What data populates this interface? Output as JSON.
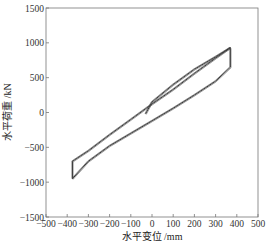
{
  "chart_data": {
    "type": "line",
    "title": "",
    "xlabel": "水平变位 /mm",
    "ylabel": "水平荷重 /kN",
    "xlim": [
      -500,
      500
    ],
    "ylim": [
      -1500,
      1500
    ],
    "x_ticks": [
      "-500",
      "-400",
      "-300",
      "-200",
      "-100",
      "0",
      "100",
      "200",
      "300",
      "400",
      "500"
    ],
    "y_ticks": [
      "1500",
      "1000",
      "500",
      "0",
      "-500",
      "-1000",
      "-1500"
    ],
    "grid": false,
    "legend": null,
    "series": [
      {
        "name": "hysteresis loop",
        "x": [
          -30,
          0,
          100,
          200,
          300,
          370,
          370,
          300,
          200,
          100,
          0,
          -100,
          -200,
          -300,
          -375,
          -375,
          -300,
          -200,
          -100,
          0,
          100,
          200,
          300,
          370
        ],
        "y": [
          -20,
          150,
          400,
          620,
          800,
          930,
          650,
          450,
          250,
          60,
          -120,
          -300,
          -480,
          -700,
          -950,
          -700,
          -550,
          -320,
          -100,
          120,
          330,
          560,
          780,
          930
        ]
      }
    ]
  }
}
